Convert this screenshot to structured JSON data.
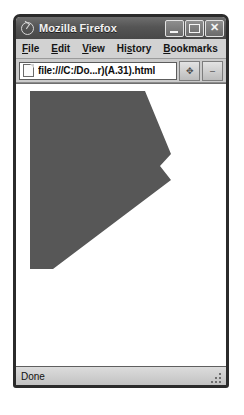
{
  "window": {
    "title": "Mozilla Firefox",
    "app_icon": "firefox-icon",
    "controls": {
      "minimize_label": "_",
      "maximize_label": "□",
      "close_label": "✕"
    }
  },
  "menubar": {
    "items": [
      {
        "label": "File",
        "accel": "F"
      },
      {
        "label": "Edit",
        "accel": "E"
      },
      {
        "label": "View",
        "accel": "V"
      },
      {
        "label": "History",
        "accel": "s"
      },
      {
        "label": "Bookmarks",
        "accel": "B"
      },
      {
        "label": "To",
        "accel": "T"
      }
    ]
  },
  "navbar": {
    "favicon": "page-icon",
    "url": "file:///C:/Do...r)(A.31).html",
    "url_placeholder": "Search or enter address",
    "buttons": [
      {
        "name": "move-button",
        "glyph": "✥"
      },
      {
        "name": "dropdown-button",
        "glyph": "–"
      }
    ]
  },
  "content": {
    "shape_name": "concave-arrow-polygon",
    "fill_color": "#575757",
    "background_color": "#ffffff",
    "viewport_width": 210,
    "viewport_height": 286,
    "points": "14,7 129,7 155,70 144,82 155,96 37,185 37,184 14,184 14,7",
    "polygon_points": [
      [
        14,
        7
      ],
      [
        129,
        7
      ],
      [
        155,
        70
      ],
      [
        144,
        82
      ],
      [
        155,
        96
      ],
      [
        37,
        185
      ],
      [
        14,
        185
      ]
    ]
  },
  "statusbar": {
    "status": "Done",
    "resize_grip": "resize-grip-icon"
  }
}
